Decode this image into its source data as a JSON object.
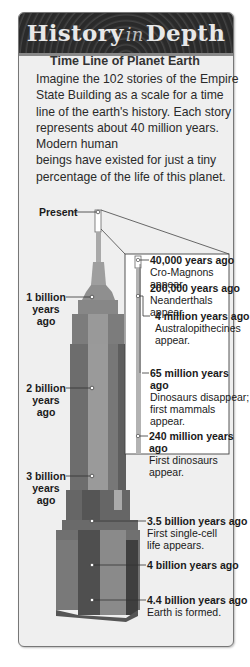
{
  "header": {
    "title_part1": "History",
    "title_in": "in",
    "title_part2": "Depth"
  },
  "feature": {
    "subtitle": "Time Line of Planet Earth",
    "intro_lines": [
      "Imagine the 102 stories of the Empire",
      "State Building as a scale for a time",
      "line of the earth's history. Each story",
      "represents about 40 million years.",
      "Modern human",
      "beings have existed for just a tiny",
      "percentage of the life of this planet."
    ]
  },
  "timeline": {
    "present_label": "Present",
    "left_labels": [
      {
        "line1": "1 billion",
        "line2": "years ago"
      },
      {
        "line1": "2 billion",
        "line2": "years ago"
      },
      {
        "line1": "3 billion",
        "line2": "years ago"
      }
    ],
    "inset_events": [
      {
        "time": "40,000 years ago",
        "desc": "Cro-Magnons appear."
      },
      {
        "time": "200,000 years ago",
        "desc": "Neanderthals appear."
      },
      {
        "time": "4 million years ago",
        "desc_line1": "Australopithecines",
        "desc_line2": "appear."
      },
      {
        "time": "65 million years ago",
        "desc_line1": "Dinosaurs disappear;",
        "desc_line2": "first mammals appear."
      },
      {
        "time": "240 million years ago",
        "desc": "First dinosaurs appear."
      }
    ],
    "lower_events": [
      {
        "time": "3.5 billion years ago",
        "desc_line1": "First single-cell",
        "desc_line2": "life appears."
      },
      {
        "time": "4 billion years ago"
      },
      {
        "time": "4.4 billion years ago",
        "desc": "Earth is formed."
      }
    ]
  }
}
